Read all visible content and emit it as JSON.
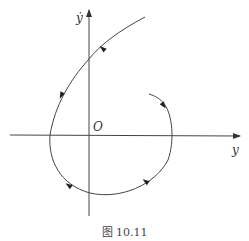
{
  "figure": {
    "caption": "图 10.11",
    "axes": {
      "x_label": "y",
      "y_label": "ẏ",
      "origin_label": "O"
    },
    "colors": {
      "line": "#444444",
      "text": "#333333"
    },
    "trajectory": {
      "description": "Phase-plane trajectory spiraling: enters from upper right, passes left across the ẏ-axis, loops clockwise-counter around below the origin and ends inside, right of the origin",
      "direction_arrows": 5
    }
  }
}
